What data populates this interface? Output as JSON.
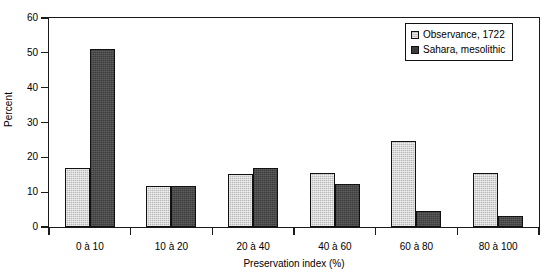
{
  "chart_data": {
    "type": "bar",
    "title": "",
    "subtitle": "",
    "xlabel": "Preservation index (%)",
    "ylabel": "Percent",
    "categories": [
      "0 à 10",
      "10 à 20",
      "20 à 40",
      "40 à 60",
      "60 à 80",
      "80 à 100"
    ],
    "series": [
      {
        "name": "Observance, 1722",
        "values": [
          17,
          11.7,
          15.3,
          15.5,
          24.7,
          15.5
        ],
        "color": "#b9b9b9"
      },
      {
        "name": "Sahara, mesolithic",
        "values": [
          51,
          11.7,
          17,
          12.4,
          4.5,
          3.2
        ],
        "color": "#4a4a4a"
      }
    ],
    "ylim": [
      0,
      60
    ],
    "yticks": [
      0,
      10,
      20,
      30,
      40,
      50,
      60
    ],
    "ytick_labels": [
      "0",
      "10",
      "20",
      "30",
      "40",
      "50",
      "60"
    ],
    "grid": false,
    "legend_position": "top-right",
    "axis_color": "#1a1a1a",
    "background": "#ffffff"
  },
  "legend": {
    "entries": [
      {
        "label": "Observance, 1722",
        "swatch": "light-gray-square-icon"
      },
      {
        "label": "Sahara, mesolithic",
        "swatch": "dark-gray-square-icon"
      }
    ]
  }
}
